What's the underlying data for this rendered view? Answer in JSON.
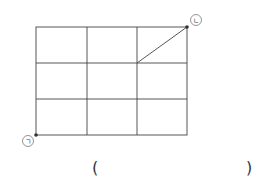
{
  "diagram": {
    "grid": {
      "cols": 3,
      "rows": 3,
      "x0": 36,
      "y0": 27,
      "cell_w": 50.33,
      "cell_h": 36
    },
    "labels": {
      "start": "ㄱ",
      "end": "ㄴ"
    },
    "line_color": "#444444",
    "path_segment": {
      "from": [
        137,
        63
      ],
      "to": [
        187,
        27
      ]
    }
  },
  "answer": {
    "open": "(",
    "close": ")"
  }
}
